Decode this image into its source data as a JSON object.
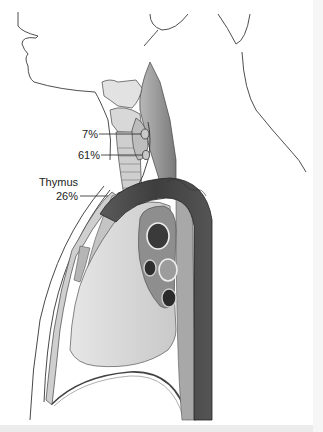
{
  "figure": {
    "labels": [
      {
        "id": "upper-parathyroid",
        "text": "7%"
      },
      {
        "id": "lower-parathyroid",
        "text": "61%"
      },
      {
        "id": "thymus-organ",
        "text": "Thymus"
      },
      {
        "id": "thymus-parathyroid",
        "text": "26%"
      }
    ],
    "colors": {
      "background": "#ffffff",
      "outline": "#3a3a3a",
      "lung": "#d4d4d4",
      "aorta": "#4a4a4a",
      "muscle": "#8a8a8a",
      "cartilage": "#e0e0e0",
      "vessel_dark": "#2e2e2e",
      "vessel_mid": "#9a9a9a"
    }
  }
}
